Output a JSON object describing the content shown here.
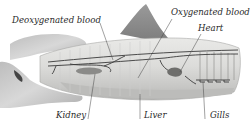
{
  "diagram": {
    "labels": {
      "deoxygenated_blood": "Deoxygenated blood",
      "oxygenated_blood": "Oxygenated blood",
      "heart": "Heart",
      "kidney": "Kidney",
      "liver": "Liver",
      "gills": "Gills"
    },
    "colors": {
      "body": "#d9d9d7",
      "fin": "#8e8e8e",
      "hand": "#c9c9c9",
      "vessel": "#3a3a3a",
      "organ": "#7a7a7a",
      "text": "#2a2a2a"
    }
  }
}
